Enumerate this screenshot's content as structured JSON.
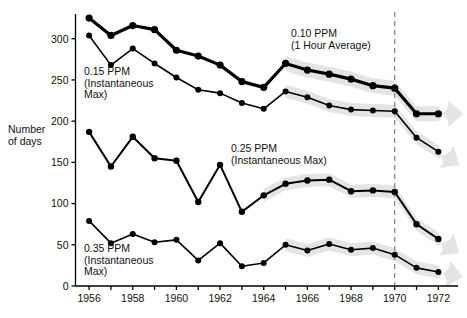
{
  "chart_data": {
    "type": "line",
    "title": "",
    "xlabel": "",
    "ylabel": "Number of days",
    "xlim": [
      1955.4,
      1972.9
    ],
    "ylim": [
      0,
      330
    ],
    "grid": false,
    "legend_position": "inline-annotations",
    "x": [
      1956,
      1957,
      1958,
      1959,
      1960,
      1961,
      1962,
      1963,
      1964,
      1965,
      1966,
      1967,
      1968,
      1969,
      1970,
      1971,
      1972
    ],
    "xticks": [
      1956,
      1957,
      1958,
      1959,
      1960,
      1961,
      1962,
      1963,
      1964,
      1965,
      1966,
      1967,
      1968,
      1969,
      1970,
      1971,
      1972
    ],
    "xtick_labels": [
      "1956",
      "",
      "1958",
      "",
      "1960",
      "",
      "1962",
      "",
      "1964",
      "",
      "1966",
      "",
      "1968",
      "",
      "1970",
      "",
      "1972"
    ],
    "yticks": [
      0,
      50,
      100,
      150,
      200,
      250,
      300
    ],
    "ytick_labels": [
      "0",
      "50",
      "100",
      "150",
      "200",
      "250",
      "300"
    ],
    "series": [
      {
        "name": "0.10 PPM (1 Hour Average)",
        "label_line1": "0.10 PPM",
        "label_line2": "(1 Hour Average)",
        "color": "#000000",
        "linewidth": 3.2,
        "values": [
          325,
          304,
          316,
          311,
          286,
          279,
          268,
          248,
          241,
          270,
          262,
          257,
          251,
          243,
          240,
          209,
          209
        ]
      },
      {
        "name": "0.15 PPM (Instantaneous Max)",
        "label_line1": "0.15 PPM",
        "label_line2": "(Instantaneous",
        "label_line3": "Max)",
        "color": "#000000",
        "linewidth": 1.6,
        "values": [
          304,
          268,
          288,
          270,
          253,
          238,
          234,
          222,
          215,
          236,
          229,
          219,
          214,
          213,
          212,
          180,
          163
        ]
      },
      {
        "name": "0.25 PPM (Instantaneous Max)",
        "label_line1": "0.25 PPM",
        "label_line2": "(Instantaneous Max)",
        "color": "#000000",
        "linewidth": 2.0,
        "values": [
          187,
          145,
          181,
          155,
          152,
          102,
          147,
          90,
          110,
          124,
          128,
          129,
          115,
          116,
          114,
          75,
          57
        ]
      },
      {
        "name": "0.35 PPM (Instantaneous Max)",
        "label_line1": "0.35 PPM",
        "label_line2": "(Instantaneous",
        "label_line3": "Max)",
        "color": "#000000",
        "linewidth": 1.6,
        "values": [
          79,
          52,
          63,
          53,
          56,
          31,
          52,
          24,
          28,
          50,
          43,
          51,
          44,
          46,
          38,
          22,
          17
        ]
      }
    ],
    "trend_bands": [
      {
        "for_series": "0.10 PPM (1 Hour Average)",
        "x_start": 1965,
        "x_end": 1972.85,
        "color": "#e3e3e3"
      },
      {
        "for_series": "0.15 PPM (Instantaneous Max)",
        "x_start": 1964.6,
        "x_end": 1972.85,
        "color": "#e3e3e3"
      },
      {
        "for_series": "0.25 PPM (Instantaneous Max)",
        "x_start": 1963.8,
        "x_end": 1972.85,
        "color": "#e3e3e3"
      },
      {
        "for_series": "0.35 PPM (Instantaneous Max)",
        "x_start": 1964.6,
        "x_end": 1972.6,
        "color": "#e3e3e3"
      }
    ],
    "reference_line": {
      "x": 1970,
      "style": "dashed",
      "color": "#808080"
    }
  },
  "annotations": {
    "ppm010": {
      "line1": "0.10 PPM",
      "line2": "(1 Hour Average)"
    },
    "ppm015": {
      "line1": "0.15 PPM",
      "line2": "(Instantaneous",
      "line3": "Max)"
    },
    "ppm025": {
      "line1": "0.25 PPM",
      "line2": "(Instantaneous Max)"
    },
    "ppm035": {
      "line1": "0.35 PPM",
      "line2": "(Instantaneous",
      "line3": "Max)"
    }
  },
  "axis": {
    "y_title_line1": "Number",
    "y_title_line2": "of days"
  }
}
